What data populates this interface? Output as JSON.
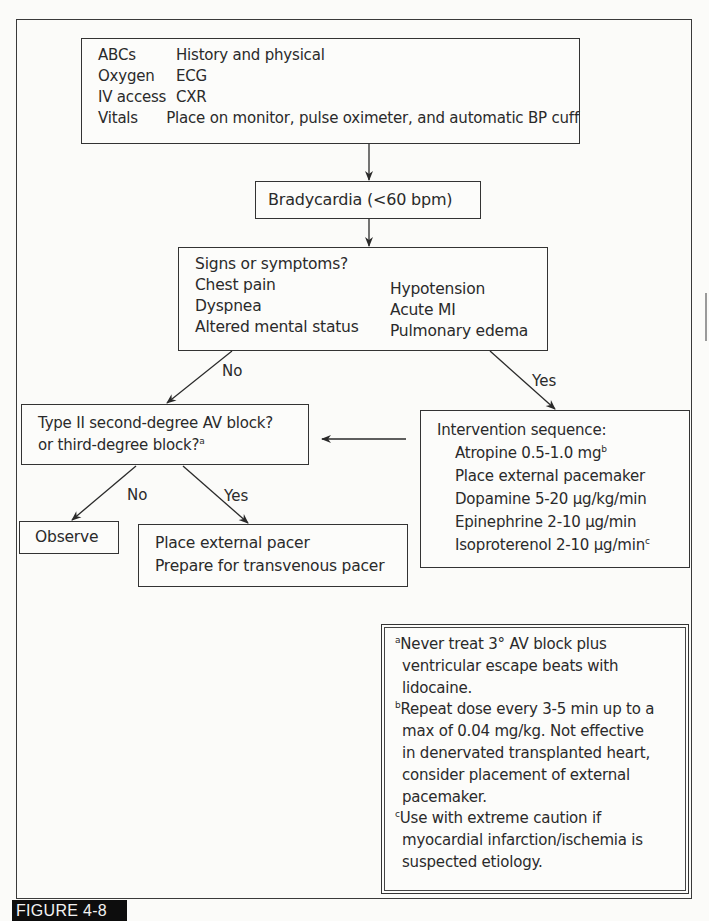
{
  "figure_label": "FIGURE 4-8",
  "initial_box": {
    "rows": [
      {
        "left": "ABCs",
        "right": "History and physical"
      },
      {
        "left": "Oxygen",
        "right": "ECG"
      },
      {
        "left": "IV access",
        "right": "CXR"
      },
      {
        "left": "Vitals",
        "right": "Place on monitor, pulse oximeter, and automatic BP cuff"
      }
    ]
  },
  "bradycardia_box": {
    "text": "Bradycardia (<60 bpm)"
  },
  "signs_box": {
    "title": "Signs or symptoms?",
    "left_items": [
      "Chest pain",
      "Dyspnea",
      "Altered mental status"
    ],
    "right_items": [
      "Hypotension",
      "Acute MI",
      "Pulmonary edema"
    ]
  },
  "branch_labels": {
    "signs_no": "No",
    "signs_yes": "Yes",
    "block_no": "No",
    "block_yes": "Yes"
  },
  "block_box": {
    "line1": "Type II second-degree AV block?",
    "line2": "or third-degree block?",
    "line2_sup": "a"
  },
  "intervention_box": {
    "title": "Intervention sequence:",
    "items": [
      {
        "text": "Atropine 0.5-1.0 mg",
        "sup": "b"
      },
      {
        "text": "Place external pacemaker",
        "sup": ""
      },
      {
        "text": "Dopamine 5-20 µg/kg/min",
        "sup": ""
      },
      {
        "text": "Epinephrine 2-10 µg/min",
        "sup": ""
      },
      {
        "text": "Isoproterenol 2-10 µg/min",
        "sup": "c"
      }
    ]
  },
  "observe_box": {
    "text": "Observe"
  },
  "pacer_box": {
    "line1": "Place external pacer",
    "line2": "Prepare for transvenous pacer"
  },
  "footnotes": [
    {
      "marker": "a",
      "lines": [
        "Never treat 3° AV block plus",
        "ventricular escape beats with",
        "lidocaine."
      ]
    },
    {
      "marker": "b",
      "lines": [
        "Repeat dose every 3-5 min up to a",
        "max of 0.04 mg/kg. Not effective",
        "in denervated transplanted heart,",
        "consider placement of external",
        "pacemaker."
      ]
    },
    {
      "marker": "c",
      "lines": [
        "Use with extreme caution if",
        "myocardial infarction/ischemia is",
        "suspected etiology."
      ]
    }
  ]
}
